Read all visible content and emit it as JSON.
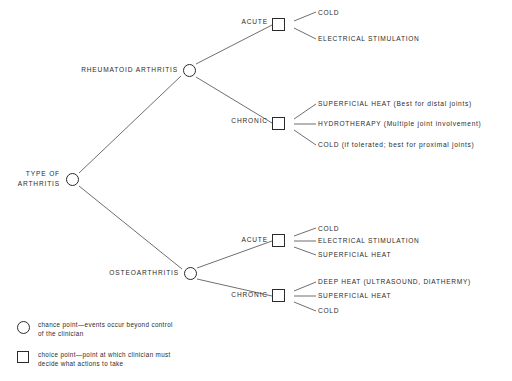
{
  "diagram": {
    "type": "decision-tree",
    "background_color": "#ffffff",
    "stroke_color": "#2b2b2b",
    "root": {
      "label": "TYPE OF\nARTHRITIS",
      "node_type": "chance-point"
    },
    "branches": [
      {
        "label": "RHEUMATOID ARTHRITIS",
        "node_type": "chance-point",
        "children": [
          {
            "label": "ACUTE",
            "node_type": "choice-point",
            "leaves": [
              {
                "text": "COLD"
              },
              {
                "text": "ELECTRICAL STIMULATION"
              }
            ]
          },
          {
            "label": "CHRONIC",
            "node_type": "choice-point",
            "leaves": [
              {
                "text": "SUPERFICIAL HEAT (Best for distal joints)"
              },
              {
                "text": "HYDROTHERAPY (Multiple joint involvement)"
              },
              {
                "text": "COLD (if tolerated; best for proximal joints)"
              }
            ]
          }
        ]
      },
      {
        "label": "OSTEOARTHRITIS",
        "node_type": "chance-point",
        "children": [
          {
            "label": "ACUTE",
            "node_type": "choice-point",
            "leaves": [
              {
                "text": "COLD"
              },
              {
                "text": "ELECTRICAL STIMULATION"
              },
              {
                "text": "SUPERFICIAL HEAT"
              }
            ]
          },
          {
            "label": "CHRONIC",
            "node_type": "choice-point",
            "leaves": [
              {
                "text": "DEEP HEAT (ULTRASOUND, DIATHERMY)"
              },
              {
                "text": "SUPERFICIAL HEAT"
              },
              {
                "text": "COLD"
              }
            ]
          }
        ]
      }
    ]
  },
  "legend": {
    "items": [
      {
        "shape": "circle",
        "text": "chance point—events occur beyond control\nof the clinician"
      },
      {
        "shape": "square",
        "text": "choice point—point at which clinician must\ndecide what actions to take"
      }
    ]
  }
}
